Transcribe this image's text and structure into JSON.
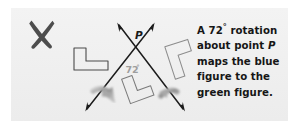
{
  "figure": {
    "kind": "geometry-rotation-illustration",
    "background_color": "#f1f1f1",
    "page_color": "#ffffff",
    "ink_color": "#1a1a1a",
    "shape_outline_color": "#555555",
    "angle_label_color": "#9a9a9a",
    "curved_arrow_color": "#9b9b9b",
    "x_mark": {
      "name": "x-mark",
      "color": "#545454",
      "description": "thick hand-drawn X stroke, upper-left"
    },
    "point_label": "P",
    "angle_label": "72°",
    "angle_value": 72,
    "angle_unit": "degrees",
    "rays": [
      {
        "name": "ray-up-left",
        "arrowhead": "up-left"
      },
      {
        "name": "ray-up-right",
        "arrowhead": "up-right"
      },
      {
        "name": "ray-down-left",
        "arrowhead": "down-left"
      },
      {
        "name": "ray-down-right",
        "arrowhead": "down-right"
      }
    ],
    "shapes": [
      {
        "name": "blue-L-figure",
        "label": "blue figure",
        "position": "left",
        "rotation_deg": 0
      },
      {
        "name": "intermediate-L-figure",
        "label": "intermediate figure",
        "position": "bottom-center",
        "rotation_deg": -18
      },
      {
        "name": "green-L-figure",
        "label": "green figure",
        "position": "right",
        "rotation_deg": 72
      }
    ],
    "curved_arrows": [
      {
        "name": "curved-arrow-left",
        "position": "bottom-left"
      },
      {
        "name": "curved-arrow-right",
        "position": "bottom-right"
      }
    ]
  },
  "caption": {
    "full_text": "A 72° rotation about point P maps the blue figure to the green figure.",
    "line1_a": "A 72",
    "line1_deg": "°",
    "line1_b": " rotation",
    "line2_a": "about point ",
    "line2_p": "P",
    "line3": "maps the blue",
    "line4": "figure to the",
    "line5": "green figure."
  }
}
